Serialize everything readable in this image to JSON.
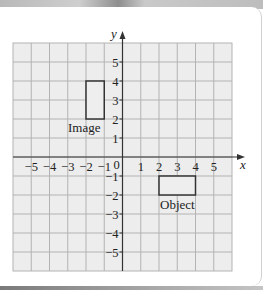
{
  "diagram": {
    "type": "coordinate-grid",
    "axes": {
      "x_label": "x",
      "y_label": "y",
      "x_range": [
        -6,
        6
      ],
      "y_range": [
        -6,
        6
      ],
      "x_ticks": [
        "−5",
        "−4",
        "−3",
        "−2",
        "−1",
        "0",
        "1",
        "2",
        "3",
        "4",
        "5"
      ],
      "y_ticks": [
        "5",
        "4",
        "3",
        "2",
        "1",
        "−1",
        "−2",
        "−3",
        "−4",
        "−5"
      ]
    },
    "shapes": [
      {
        "name": "image",
        "label": "Image",
        "x1": -2,
        "y1": 2,
        "x2": -1,
        "y2": 4
      },
      {
        "name": "object",
        "label": "Object",
        "x1": 2,
        "y1": -2,
        "x2": 4,
        "y2": -1
      }
    ],
    "colors": {
      "grid_fill": "#ededed",
      "grid_line": "#b3b3b3",
      "axis": "#333333",
      "shape_stroke": "#333333",
      "shape_fill": "#eeeeee"
    }
  }
}
